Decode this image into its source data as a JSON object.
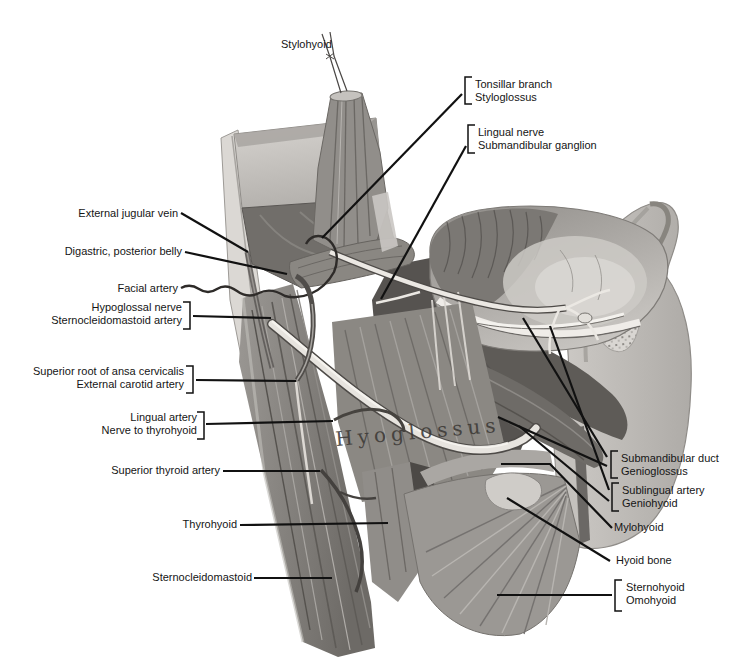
{
  "annotations": {
    "muscle_text": "Hyoglossus",
    "top": [
      {
        "lines": [
          "Stylohyoid"
        ]
      }
    ],
    "upper_right": [
      {
        "lines": [
          "Tonsillar branch",
          "Styloglossus"
        ],
        "bracket": "left"
      },
      {
        "lines": [
          "Lingual nerve",
          "Submandibular ganglion"
        ],
        "bracket": "left"
      }
    ],
    "left": [
      {
        "lines": [
          "External jugular vein"
        ]
      },
      {
        "lines": [
          "Digastric, posterior belly"
        ]
      },
      {
        "lines": [
          "Facial artery"
        ]
      },
      {
        "lines": [
          "Hypoglossal nerve",
          "Sternocleidomastoid artery"
        ],
        "bracket": "right"
      },
      {
        "lines": [
          "Superior root of ansa cervicalis",
          "External carotid artery"
        ],
        "bracket": "right"
      },
      {
        "lines": [
          "Lingual artery",
          "Nerve to thyrohyoid"
        ],
        "bracket": "right"
      },
      {
        "lines": [
          "Superior thyroid artery"
        ]
      },
      {
        "lines": [
          "Thyrohyoid"
        ]
      },
      {
        "lines": [
          "Sternocleidomastoid"
        ]
      }
    ],
    "right": [
      {
        "lines": [
          "Submandibular duct",
          "Genioglossus"
        ],
        "bracket": "left"
      },
      {
        "lines": [
          "Sublingual artery",
          "Geniohyoid"
        ],
        "bracket": "left"
      },
      {
        "lines": [
          "Mylohyoid"
        ]
      },
      {
        "lines": [
          "Hyoid bone"
        ]
      },
      {
        "lines": [
          "Sternohyoid",
          "Omohyoid"
        ],
        "bracket": "left"
      }
    ]
  },
  "colors": {
    "background": "#ffffff",
    "label_ink": "#151515",
    "leader_line": "#111111",
    "illustration_grays": {
      "cut_surface": "#d6d3cf",
      "mid_flesh": "#b0ada8",
      "muscle": "#96938e",
      "deep_shadow": "#565350",
      "pale_nerve": "#ebe8e3"
    }
  }
}
